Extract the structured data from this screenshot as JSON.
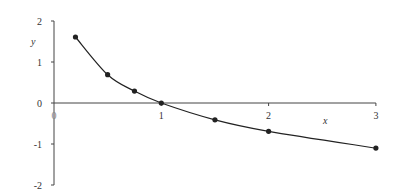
{
  "chart_data": {
    "type": "line",
    "title": "",
    "xlabel": "x",
    "ylabel": "y",
    "xlim": [
      0,
      3
    ],
    "ylim": [
      -2,
      2
    ],
    "x_ticks": [
      {
        "value": 0,
        "label": "0"
      },
      {
        "value": 1,
        "label": "1"
      },
      {
        "value": 2,
        "label": "2"
      },
      {
        "value": 3,
        "label": "3"
      }
    ],
    "y_ticks": [
      {
        "value": 2,
        "label": "2"
      },
      {
        "value": 1,
        "label": "1"
      },
      {
        "value": 0,
        "label": "0"
      },
      {
        "value": -1,
        "label": "-1"
      },
      {
        "value": -2,
        "label": "-2"
      }
    ],
    "grid": false,
    "legend": null,
    "series": [
      {
        "name": "y = -ln x",
        "color": "#222222",
        "marker": "circle",
        "smooth": true,
        "x": [
          0.2,
          0.5,
          0.75,
          1,
          1.5,
          2,
          3
        ],
        "y": [
          1.61,
          0.69,
          0.29,
          0,
          -0.41,
          -0.69,
          -1.1
        ]
      }
    ]
  },
  "layout": {
    "origin_px": {
      "x": 54,
      "y": 103
    },
    "px_per_x": 107.3,
    "px_per_y": 41,
    "axis_color": "#444444",
    "line_color": "#222222",
    "zero_label_color": "#888888"
  }
}
